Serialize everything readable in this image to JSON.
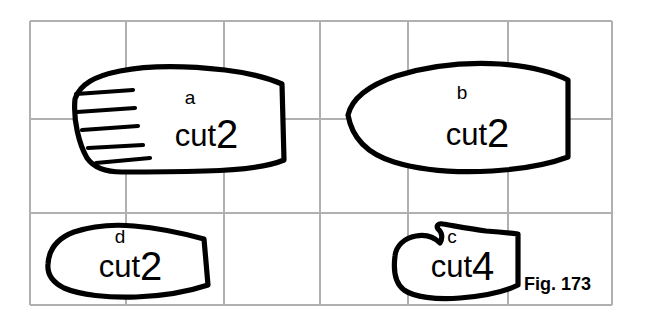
{
  "figure": {
    "caption": "Fig. 173",
    "background_color": "#ffffff",
    "ink_color": "#000000",
    "grid_color": "#b0b0b0",
    "grid": {
      "columns": 6,
      "rows": 3,
      "x_lines": [
        30,
        126,
        224,
        320,
        408,
        508,
        612
      ],
      "y_lines": [
        21,
        119,
        213,
        305
      ]
    }
  },
  "pattern_pieces": [
    {
      "id": "piece-a",
      "letter": "a",
      "cut_word": "cut",
      "cut_count": "2",
      "has_hatching": true,
      "hatch_count": 5,
      "letter_pos": {
        "x": 190,
        "y": 104
      },
      "cut_word_pos": {
        "x": 216,
        "y": 146
      },
      "cut_number_pos": {
        "x": 216,
        "y": 148
      },
      "outline": "M 75 99 C 80 84 95 76 120 71 C 150 65 190 66 225 70 C 250 73 268 78 282 84 L 284 160 C 270 166 240 170 205 171 C 170 172 140 172 122 172 C 106 172 94 168 87 158 C 79 144 73 120 75 99 Z",
      "hatch_lines": [
        {
          "x1": 76,
          "y1": 94,
          "x2": 133,
          "y2": 90
        },
        {
          "x1": 77,
          "y1": 112,
          "x2": 135,
          "y2": 108
        },
        {
          "x1": 82,
          "y1": 130,
          "x2": 138,
          "y2": 126
        },
        {
          "x1": 88,
          "y1": 148,
          "x2": 143,
          "y2": 145
        },
        {
          "x1": 96,
          "y1": 163,
          "x2": 150,
          "y2": 158
        }
      ]
    },
    {
      "id": "piece-b",
      "letter": "b",
      "cut_word": "cut",
      "cut_count": "2",
      "has_hatching": false,
      "hatch_count": 0,
      "letter_pos": {
        "x": 462,
        "y": 99
      },
      "cut_word_pos": {
        "x": 487,
        "y": 145
      },
      "cut_number_pos": {
        "x": 487,
        "y": 147
      },
      "outline": "M 348 115 C 352 98 370 85 396 76 C 428 66 466 62 500 64 C 530 66 552 72 568 80 L 568 157 C 552 163 524 169 492 171 C 456 173 420 170 394 162 C 368 154 352 138 348 115 Z",
      "hatch_lines": []
    },
    {
      "id": "piece-c",
      "letter": "c",
      "cut_word": "cut",
      "cut_count": "4",
      "has_hatching": false,
      "hatch_count": 0,
      "letter_pos": {
        "x": 452,
        "y": 243
      },
      "cut_word_pos": {
        "x": 472,
        "y": 277
      },
      "cut_number_pos": {
        "x": 472,
        "y": 280
      },
      "outline": "M 395 256 C 396 246 404 238 416 236 C 427 234 435 238 440 243 C 443 238 442 232 438 229 C 436 226 438 223 443 224 C 455 226 470 229 486 231 C 500 232 510 233 518 234 L 518 285 C 506 291 484 296 460 298 C 436 300 414 297 404 290 C 396 284 393 272 395 256 Z",
      "hatch_lines": []
    },
    {
      "id": "piece-d",
      "letter": "d",
      "cut_word": "cut",
      "cut_count": "2",
      "has_hatching": false,
      "hatch_count": 0,
      "letter_pos": {
        "x": 120,
        "y": 243
      },
      "cut_word_pos": {
        "x": 140,
        "y": 277
      },
      "cut_number_pos": {
        "x": 140,
        "y": 280
      },
      "outline": "M 48 264 C 49 248 58 238 74 232 C 92 226 112 224 134 226 C 158 228 182 233 204 239 L 208 285 C 190 291 164 296 136 297 C 108 298 80 295 64 288 C 52 282 47 274 48 264 Z",
      "hatch_lines": []
    }
  ],
  "caption_pos": {
    "x": 524,
    "y": 290
  }
}
